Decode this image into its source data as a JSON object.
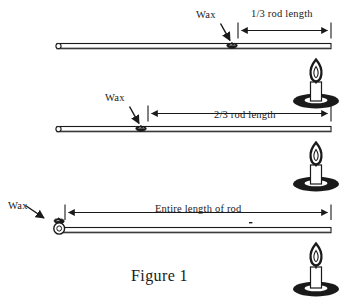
{
  "figure": {
    "caption": "Figure 1",
    "background_color": "#ffffff",
    "ink_color": "#1a1a1a",
    "rows": [
      {
        "id": "row-one-third",
        "wax_label": "Wax",
        "dimension_label": "1/3 rod length",
        "wax_position_fraction": 0.667,
        "candle_label": "candle"
      },
      {
        "id": "row-two-thirds",
        "wax_label": "Wax",
        "dimension_label": "2/3 rod length",
        "wax_position_fraction": 0.333,
        "candle_label": "candle"
      },
      {
        "id": "row-entire",
        "wax_label": "Wax",
        "dimension_label": "Entire length of rod",
        "wax_position_fraction": 0.0,
        "candle_label": "candle"
      }
    ]
  }
}
